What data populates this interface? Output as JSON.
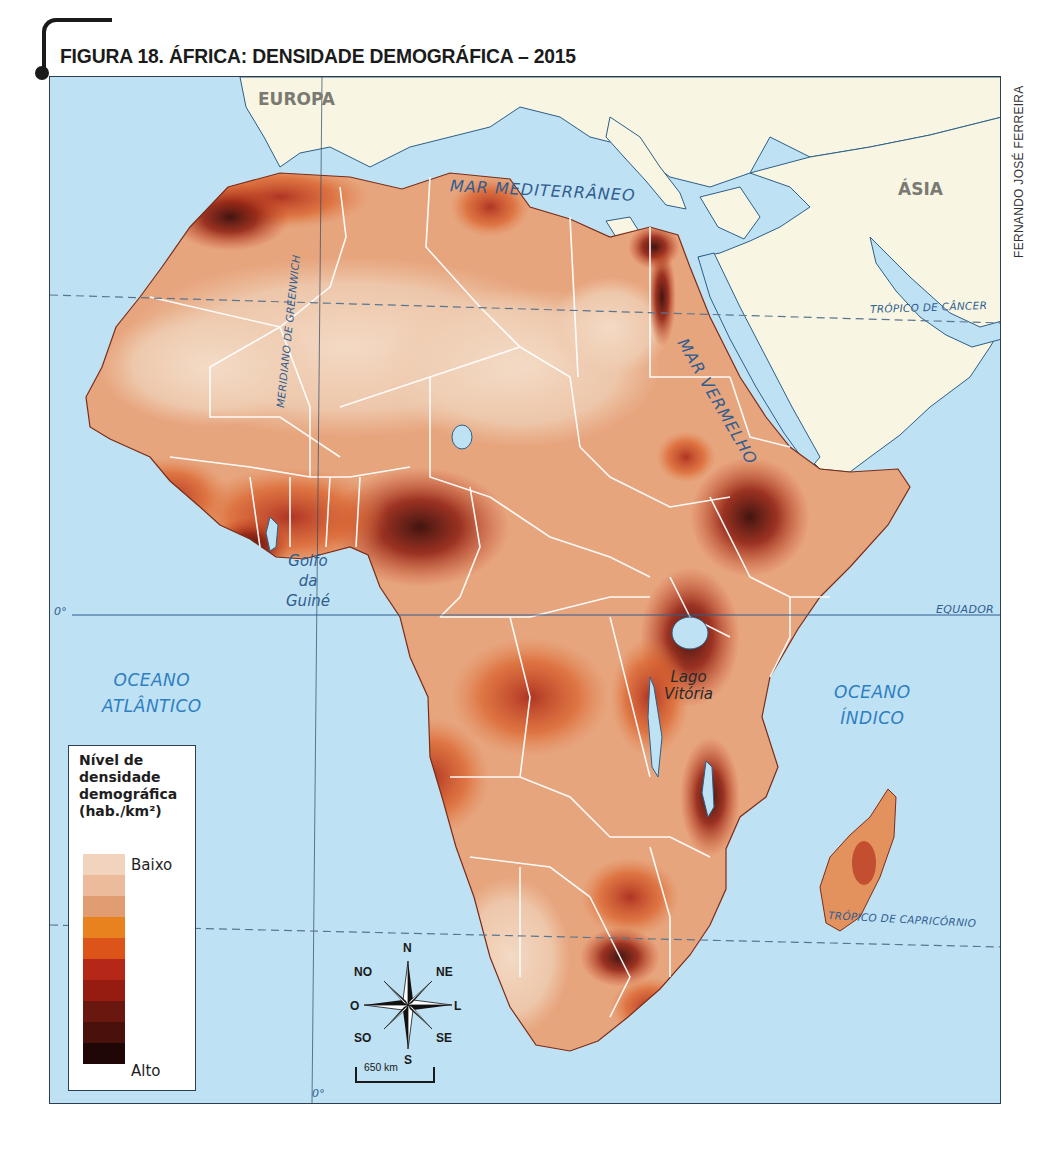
{
  "figure": {
    "title": "FIGURA 18. ÁFRICA: DENSIDADE DEMOGRÁFICA – 2015",
    "credit": "FERNANDO JOSÉ FERREIRA"
  },
  "map": {
    "colors": {
      "ocean": "#bfe1f4",
      "other_land": "#f8f6e3",
      "borders": "#ffffff",
      "coast": "#2c5f88",
      "lines": "#2f5d8f"
    },
    "labels": {
      "europa": "EUROPA",
      "asia": "ÁSIA",
      "mediterranean": "MAR MEDITERRÂNEO",
      "red_sea": "MAR VERMELHO",
      "gulf_guinea": [
        "Golfo",
        "da",
        "Guiné"
      ],
      "atlantic": [
        "OCEANO",
        "ATLÂNTICO"
      ],
      "indian": [
        "OCEANO",
        "ÍNDICO"
      ],
      "lake_victoria": [
        "Lago",
        "Vitória"
      ],
      "greenwich": "MERIDIANO DE GREENWICH",
      "equator": "EQUADOR",
      "cancer": "TRÓPICO DE CÂNCER",
      "capricorn": "TRÓPICO DE CAPRICÓRNIO",
      "zero_lat": "0°",
      "zero_lon": "0°"
    }
  },
  "legend": {
    "title": "Nível de densidade demográfica (hab./km²)",
    "low_label": "Baixo",
    "high_label": "Alto",
    "ramp": [
      "#f2d3bd",
      "#ecbb9c",
      "#e19c72",
      "#e8821f",
      "#dd541a",
      "#b52818",
      "#961c12",
      "#6a170f",
      "#4a110c",
      "#1f0708"
    ]
  },
  "compass": {
    "n": "N",
    "ne": "NE",
    "l": "L",
    "se": "SE",
    "s": "S",
    "so": "SO",
    "o": "O",
    "no": "NO"
  },
  "scale": {
    "label": "650 km"
  }
}
